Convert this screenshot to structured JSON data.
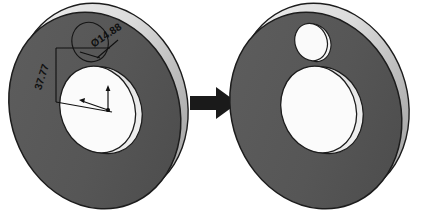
{
  "scene": {
    "title": "Washer hole feature — before and after",
    "background_color": "#ffffff",
    "transition_icon": "right-arrow-icon",
    "arrow_color": "#1a1a1a"
  },
  "colors": {
    "face_dark": "#565656",
    "face_dark_shade": "#4a4a4a",
    "rim_light": "#d8d8d8",
    "rim_highlight": "#f2f2f2",
    "bore_face": "#fbfbfb",
    "bore_wall": "#c9c9c9",
    "outline": "#1c1c1c",
    "sketch_line": "#151515",
    "dim_text": "#101010"
  },
  "before": {
    "label": "washer-with-sketch",
    "dimensions": [
      {
        "name": "hole-diameter",
        "value": "Ø14.88",
        "symbol": "Ø",
        "number": "14.88",
        "rotation_deg": -34
      },
      {
        "name": "hole-offset-vertical",
        "value": "37.77",
        "number": "37.77",
        "rotation_deg": -72
      }
    ],
    "origin_marker": "origin-axes-icon",
    "sketch_circle": "hole-sketch-circle"
  },
  "after": {
    "label": "washer-with-hole",
    "features": [
      {
        "name": "central-bore",
        "kind": "through-hole"
      },
      {
        "name": "drilled-hole",
        "kind": "through-hole"
      }
    ]
  }
}
